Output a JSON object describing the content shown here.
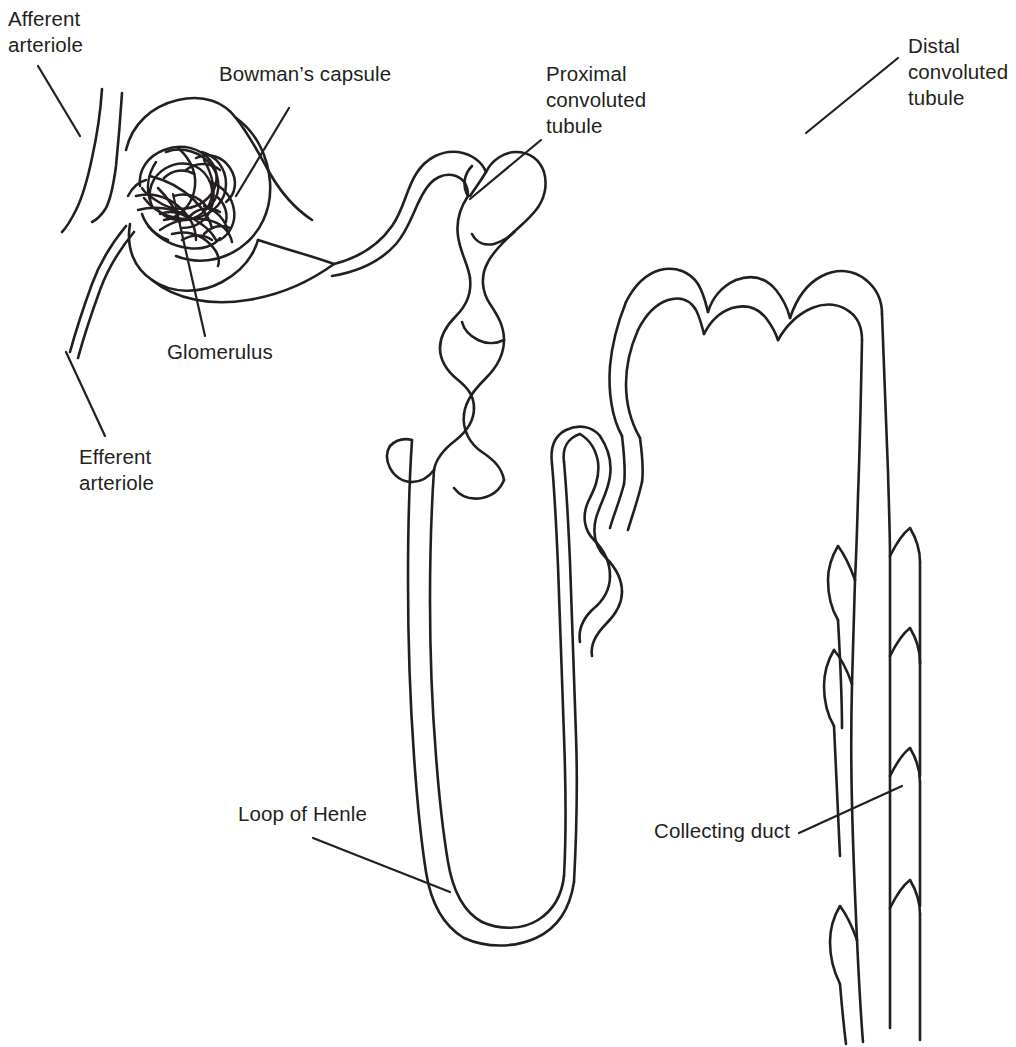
{
  "figure": {
    "background_color": "#ffffff",
    "line_color": "#231f20",
    "text_color": "#231f20"
  },
  "labels": {
    "afferent_arteriole": "Afferent\narteriole",
    "bowmans_capsule": "Bowman’s capsule",
    "proximal_convoluted_tubule": "Proximal\nconvoluted\ntubule",
    "distal_convoluted_tubule": "Distal\nconvoluted\ntubule",
    "glomerulus": "Glomerulus",
    "efferent_arteriole": "Efferent\narteriole",
    "loop_of_henle": "Loop of Henle",
    "collecting_duct": "Collecting duct"
  },
  "parts": [
    {
      "id": "afferent-arteriole",
      "name": "Afferent arteriole"
    },
    {
      "id": "efferent-arteriole",
      "name": "Efferent arteriole"
    },
    {
      "id": "glomerulus",
      "name": "Glomerulus"
    },
    {
      "id": "bowmans-capsule",
      "name": "Bowman’s capsule"
    },
    {
      "id": "proximal-tubule",
      "name": "Proximal convoluted tubule"
    },
    {
      "id": "loop-of-henle",
      "name": "Loop of Henle"
    },
    {
      "id": "distal-tubule",
      "name": "Distal convoluted tubule"
    },
    {
      "id": "collecting-duct",
      "name": "Collecting duct"
    }
  ]
}
